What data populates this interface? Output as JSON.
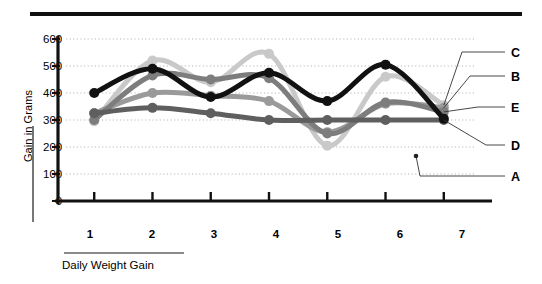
{
  "chart_data": {
    "type": "line",
    "title": "",
    "subtitle": "",
    "xlabel": "Daily Weight Gain",
    "ylabel": "Gain in Grams",
    "x": [
      1,
      2,
      3,
      4,
      5,
      6,
      7
    ],
    "categories": [
      "1",
      "2",
      "3",
      "4",
      "5",
      "6",
      "7"
    ],
    "xlim": [
      0.55,
      7.45
    ],
    "ylim": [
      0,
      600
    ],
    "ytick_values": [
      0,
      100,
      200,
      300,
      400,
      500,
      600
    ],
    "ytick_labels": [
      "0",
      "100",
      "200",
      "300",
      "400",
      "500",
      "600"
    ],
    "xtick_labels": [
      "1",
      "2",
      "3",
      "4",
      "5",
      "6",
      "7"
    ],
    "grid": "horizontal-dotted",
    "legend_position": "right-leader-lines",
    "markers": "filled-circle",
    "series": [
      {
        "name": "A",
        "label": "A",
        "color": "#111111",
        "width": 5.0,
        "marker_size": 5.0,
        "values": [
          400,
          490,
          385,
          475,
          370,
          505,
          305
        ]
      },
      {
        "name": "B",
        "label": "B",
        "color": "#9a9a9a",
        "width": 5.0,
        "marker_size": 5.0,
        "values": [
          325,
          400,
          390,
          370,
          255,
          360,
          345
        ]
      },
      {
        "name": "C",
        "label": "C",
        "color": "#c9c9c9",
        "width": 5.0,
        "marker_size": 5.0,
        "values": [
          295,
          520,
          440,
          545,
          205,
          460,
          355
        ]
      },
      {
        "name": "D",
        "label": "D",
        "color": "#5f5f5f",
        "width": 5.0,
        "marker_size": 5.0,
        "values": [
          325,
          345,
          325,
          300,
          300,
          300,
          300
        ]
      },
      {
        "name": "E",
        "label": "E",
        "color": "#7d7d7d",
        "width": 5.0,
        "marker_size": 5.0,
        "values": [
          300,
          465,
          450,
          455,
          250,
          365,
          330
        ]
      }
    ],
    "legend_order_top_to_bottom": [
      "C",
      "B",
      "E",
      "D",
      "A"
    ]
  },
  "axes": {
    "y_title": "Gain in Grams",
    "x_title": "Daily Weight Gain",
    "y_ticks": [
      "600",
      "500",
      "400",
      "300",
      "200",
      "100",
      "0"
    ],
    "x_ticks": [
      "1",
      "2",
      "3",
      "4",
      "5",
      "6",
      "7"
    ]
  },
  "legend": {
    "entries": [
      {
        "label": "C",
        "series": "C"
      },
      {
        "label": "B",
        "series": "B"
      },
      {
        "label": "E",
        "series": "E"
      },
      {
        "label": "D",
        "series": "D"
      },
      {
        "label": "A",
        "series": "A"
      }
    ]
  },
  "colors": {
    "rule": "#111111",
    "axis": "#111111",
    "grid": "#b8b8b8",
    "background": "#ffffff"
  }
}
